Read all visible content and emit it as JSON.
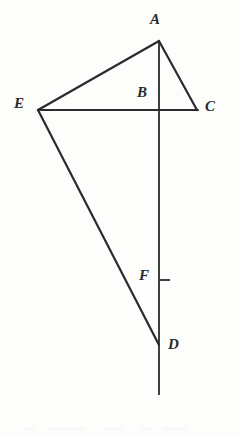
{
  "figure": {
    "canvas": {
      "width": 240,
      "height": 437
    },
    "style": {
      "background_color": "#fdfdfc",
      "ink_color": "#2b2b2b",
      "stroke_width": 2.2,
      "label_color": "#2b2b2b"
    },
    "points": [
      {
        "id": "A",
        "label": "A",
        "x": 159,
        "y": 41,
        "label_x": 150,
        "label_y": 12
      },
      {
        "id": "E",
        "label": "E",
        "x": 38,
        "y": 110,
        "label_x": 14,
        "label_y": 96
      },
      {
        "id": "B",
        "label": "B",
        "x": 159,
        "y": 110,
        "label_x": 137,
        "label_y": 85
      },
      {
        "id": "C",
        "label": "C",
        "x": 197,
        "y": 110,
        "label_x": 205,
        "label_y": 99
      },
      {
        "id": "F",
        "label": "F",
        "x": 159,
        "y": 280,
        "label_x": 139,
        "label_y": 268
      },
      {
        "id": "D",
        "label": "D",
        "x": 159,
        "y": 345,
        "label_x": 168,
        "label_y": 337
      }
    ],
    "segments": [
      {
        "id": "A-E",
        "from": "A",
        "to": "E",
        "x1": 159,
        "y1": 41,
        "x2": 38,
        "y2": 110
      },
      {
        "id": "A-C",
        "from": "A",
        "to": "C",
        "x1": 159,
        "y1": 41,
        "x2": 197,
        "y2": 110
      },
      {
        "id": "E-C",
        "from": "E",
        "to": "C",
        "x1": 38,
        "y1": 110,
        "x2": 198,
        "y2": 110
      },
      {
        "id": "E-D",
        "from": "E",
        "to": "D",
        "x1": 38,
        "y1": 110,
        "x2": 159,
        "y2": 345
      },
      {
        "id": "A-axis",
        "from": "A",
        "to": "axis-end",
        "x1": 159,
        "y1": 41,
        "x2": 159,
        "y2": 395
      }
    ],
    "tick_marks": [
      {
        "id": "F-tick",
        "at": "F",
        "x1": 159,
        "y1": 280,
        "x2": 170,
        "y2": 280
      }
    ]
  }
}
